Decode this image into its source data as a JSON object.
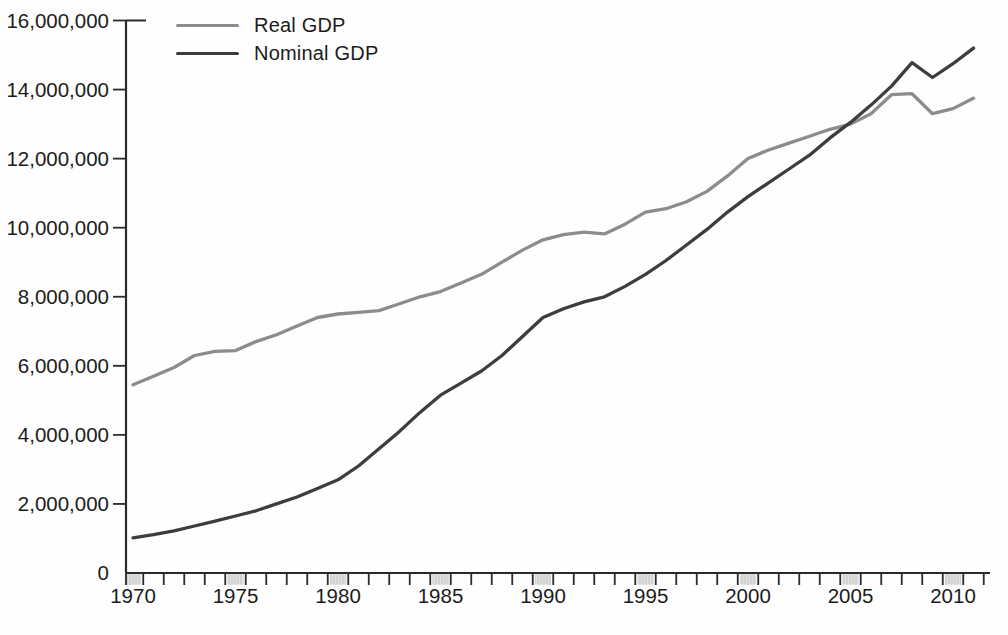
{
  "chart_data": {
    "type": "line",
    "title": "",
    "xlabel": "",
    "ylabel": "",
    "unit_note": "values as plotted on axis (0 - 16,000,000)",
    "years": [
      1970,
      1971,
      1972,
      1973,
      1974,
      1975,
      1976,
      1977,
      1978,
      1979,
      1980,
      1981,
      1982,
      1983,
      1984,
      1985,
      1986,
      1987,
      1988,
      1989,
      1990,
      1991,
      1992,
      1993,
      1994,
      1995,
      1996,
      1997,
      1998,
      1999,
      2000,
      2001,
      2002,
      2003,
      2004,
      2005,
      2006,
      2007,
      2008,
      2009,
      2010,
      2011
    ],
    "series": [
      {
        "name": "Real GDP",
        "color": "#8c8c8c",
        "values": [
          5450000,
          5700000,
          5950000,
          6300000,
          6420000,
          6440000,
          6700000,
          6900000,
          7150000,
          7400000,
          7500000,
          7550000,
          7600000,
          7800000,
          8000000,
          8150000,
          8400000,
          8650000,
          9000000,
          9350000,
          9650000,
          9800000,
          9870000,
          9820000,
          10100000,
          10450000,
          10550000,
          10750000,
          11050000,
          11500000,
          12000000,
          12250000,
          12450000,
          12650000,
          12850000,
          13000000,
          13300000,
          13850000,
          13880000,
          13300000,
          13450000,
          13750000
        ]
      },
      {
        "name": "Nominal GDP",
        "color": "#3d3d3d",
        "values": [
          1020000,
          1110000,
          1220000,
          1360000,
          1500000,
          1650000,
          1800000,
          2000000,
          2200000,
          2450000,
          2700000,
          3100000,
          3600000,
          4100000,
          4650000,
          5150000,
          5500000,
          5850000,
          6300000,
          6850000,
          7400000,
          7650000,
          7850000,
          8000000,
          8300000,
          8650000,
          9050000,
          9500000,
          9950000,
          10450000,
          10900000,
          11300000,
          11700000,
          12100000,
          12600000,
          13050000,
          13550000,
          14100000,
          14780000,
          14350000,
          14750000,
          15200000
        ]
      }
    ],
    "ylim": [
      0,
      16000000
    ],
    "y_tick_step": 2000000,
    "y_tick_labels": [
      "0",
      "2,000,000",
      "4,000,000",
      "6,000,000",
      "8,000,000",
      "10,000,000",
      "12,000,000",
      "14,000,000",
      "16,000,000"
    ],
    "x_tick_labeled_years": [
      1970,
      1975,
      1980,
      1985,
      1990,
      1995,
      2000,
      2005,
      2010
    ],
    "x_tick_every_year": true,
    "legend_position": "top-left",
    "grid": false,
    "axis_color": "#2b2b2b",
    "band_color": "#e0e0e0",
    "band_hatch_color": "#c4c4c4",
    "text_color": "#1c1c1c"
  }
}
